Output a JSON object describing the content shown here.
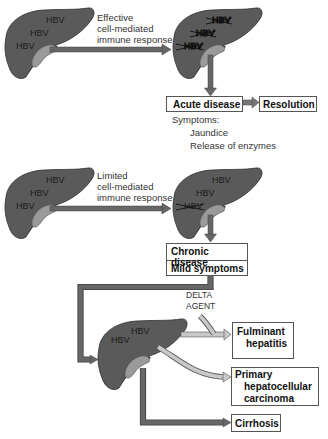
{
  "colors": {
    "liver_fill": "#5a5a5a",
    "liver_shadow": "#3c3c3c",
    "gallbladder": "#9a9a9a",
    "dark_arrow": "#666666",
    "light_arrow": "#c8c8c8",
    "box_border": "#555555"
  },
  "scenario_effective": {
    "pathway_label": [
      "Effective",
      "cell-mediated",
      "immune response"
    ],
    "liver_before": {
      "labels": [
        "HBV",
        "HBV",
        "HBV"
      ]
    },
    "liver_after": {
      "labels_crossed": [
        "HBV",
        "HBV",
        "HBV"
      ]
    },
    "outcome_box": "Acute disease",
    "resolution_box": "Resolution",
    "symptoms_heading": "Symptoms:",
    "symptoms": [
      "Jaundice",
      "Release of enzymes"
    ]
  },
  "scenario_limited": {
    "pathway_label": [
      "Limited",
      "cell-mediated",
      "immune response"
    ],
    "liver_before": {
      "labels": [
        "HBV",
        "HBV",
        "HBV"
      ]
    },
    "liver_after": {
      "labels": [
        "HBV",
        "HBV"
      ],
      "labels_crossed": [
        "HBV"
      ]
    },
    "outcome_box": [
      "Chronic disease",
      "Mild symptoms"
    ]
  },
  "chronic_liver": {
    "labels": [
      "HBV",
      "HBV"
    ],
    "cofactor_label": [
      "DELTA",
      "AGENT"
    ],
    "outcomes": [
      {
        "lines": [
          "Fulminant",
          "hepatitis"
        ]
      },
      {
        "lines": [
          "Primary",
          "hepatocellular",
          "carcinoma"
        ]
      },
      {
        "lines": [
          "Cirrhosis"
        ]
      }
    ]
  }
}
